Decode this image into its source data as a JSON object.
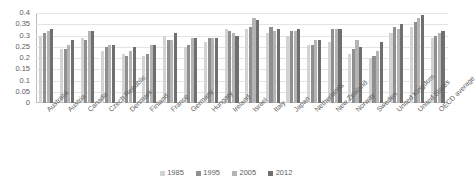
{
  "chart_data": {
    "type": "bar",
    "title": "",
    "xlabel": "",
    "ylabel": "",
    "ylim": [
      0,
      0.4
    ],
    "ytick_labels": [
      "0.4",
      "0.35",
      "0.3",
      "0.25",
      "0.2",
      "0.15",
      "0.1",
      "0.05",
      "0"
    ],
    "ytick_values": [
      0.4,
      0.35,
      0.3,
      0.25,
      0.2,
      0.15,
      0.1,
      0.05,
      0
    ],
    "grid": true,
    "legend_position": "bottom",
    "categories": [
      "Australia",
      "Austria",
      "Canada",
      "Czech Republic",
      "Denmark",
      "Finland",
      "France",
      "Germany",
      "Hungary",
      "Ireland",
      "Israel",
      "Italy",
      "Japan",
      "Netherlands",
      "New Zealand",
      "Norway",
      "Sweden",
      "United Kingdom",
      "United States",
      "OECD average"
    ],
    "series": [
      {
        "name": "1985",
        "color": "#d3d3d3",
        "values": [
          0.3,
          0.24,
          0.29,
          0.23,
          0.22,
          0.21,
          0.3,
          0.25,
          0.27,
          0.33,
          0.33,
          0.31,
          0.3,
          0.26,
          0.27,
          0.22,
          0.2,
          0.31,
          0.34,
          0.29
        ]
      },
      {
        "name": "1995",
        "color": "#8f8f8f",
        "values": [
          0.31,
          0.24,
          0.28,
          0.25,
          0.21,
          0.22,
          0.28,
          0.26,
          0.29,
          0.32,
          0.34,
          0.34,
          0.32,
          0.26,
          0.33,
          0.24,
          0.21,
          0.34,
          0.36,
          0.3
        ]
      },
      {
        "name": "2005",
        "color": "#b4b4b4",
        "values": [
          0.32,
          0.26,
          0.32,
          0.26,
          0.23,
          0.26,
          0.28,
          0.29,
          0.29,
          0.31,
          0.38,
          0.32,
          0.32,
          0.28,
          0.33,
          0.28,
          0.23,
          0.33,
          0.38,
          0.31
        ]
      },
      {
        "name": "2012",
        "color": "#6f6f6f",
        "values": [
          0.33,
          0.28,
          0.32,
          0.26,
          0.25,
          0.26,
          0.31,
          0.29,
          0.29,
          0.3,
          0.37,
          0.33,
          0.33,
          0.28,
          0.33,
          0.25,
          0.27,
          0.35,
          0.39,
          0.32
        ]
      }
    ]
  },
  "legend": {
    "items": [
      {
        "label": "1985"
      },
      {
        "label": "1995"
      },
      {
        "label": "2005"
      },
      {
        "label": "2012"
      }
    ]
  }
}
